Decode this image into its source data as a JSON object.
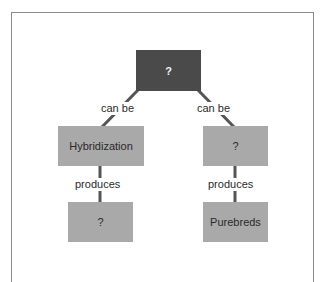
{
  "diagram": {
    "nodes": {
      "root": "?",
      "left_mid": "Hybridization",
      "right_mid": "?",
      "left_bottom": "?",
      "right_bottom": "Purebreds"
    },
    "edges": {
      "root_left": "can be",
      "root_right": "can be",
      "left_down": "produces",
      "right_down": "produces"
    },
    "colors": {
      "root_fill": "#4a4a4a",
      "node_fill": "#a9a9a9",
      "line": "#555555",
      "frame": "#8a8a8a"
    }
  }
}
